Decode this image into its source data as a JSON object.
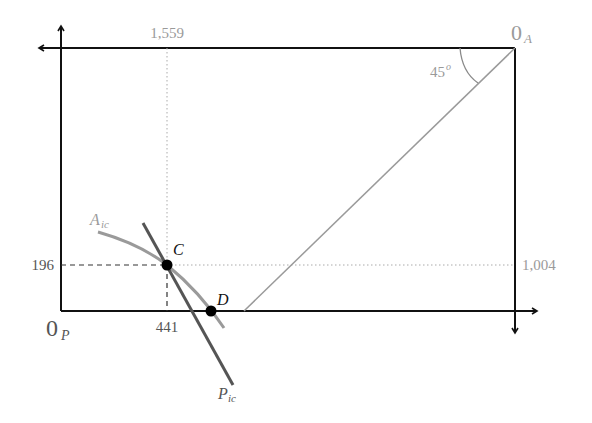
{
  "diagram": {
    "type": "edgeworth-box",
    "origins": {
      "producer": {
        "label": "0",
        "subscript": "P"
      },
      "consumer": {
        "label": "0",
        "subscript": "A"
      }
    },
    "axis_values": {
      "top_x": "1,559",
      "right_y": "1,004",
      "left_y": "196",
      "bottom_x": "441"
    },
    "angle_label": {
      "value": "45",
      "superscript": "o"
    },
    "curves": {
      "a_ic": {
        "label": "A",
        "subscript": "ic",
        "color": "#9a9a9a"
      },
      "p_ic": {
        "label": "P",
        "subscript": "ic",
        "color": "#555555"
      }
    },
    "points": {
      "c": {
        "label": "C"
      },
      "d": {
        "label": "D"
      }
    },
    "colors": {
      "axis": "#111111",
      "guide": "#9a9a9a",
      "diagonal": "#9a9a9a"
    }
  }
}
